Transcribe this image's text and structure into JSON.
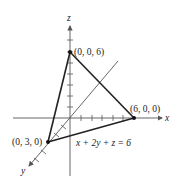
{
  "diagram": {
    "axes": {
      "x_label": "x",
      "y_label": "y",
      "z_label": "z"
    },
    "points": [
      {
        "name": "z-intercept",
        "label": "(0, 0, 6)",
        "coords": [
          0,
          0,
          6
        ]
      },
      {
        "name": "x-intercept",
        "label": "(6, 0, 0)",
        "coords": [
          6,
          0,
          0
        ]
      },
      {
        "name": "y-intercept",
        "label": "(0, 3, 0)",
        "coords": [
          0,
          3,
          0
        ]
      }
    ],
    "equation": "x + 2y + z = 6",
    "colors": {
      "triangle": "#222222",
      "axes": "#555555",
      "background": "#ffffff"
    }
  }
}
